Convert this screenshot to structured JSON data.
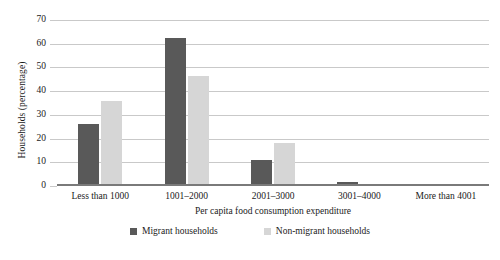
{
  "chart_data": {
    "type": "bar",
    "title": "",
    "xlabel": "Per capita food consumption expenditure",
    "ylabel": "Households (percentage)",
    "categories": [
      "Less than 1000",
      "1001–2000",
      "2001–3000",
      "3001–4000",
      "More than 4001"
    ],
    "series": [
      {
        "name": "Migrant households",
        "color": "#595959",
        "values": [
          26.0,
          62.5,
          10.8,
          1.5,
          0.4
        ]
      },
      {
        "name": "Non-migrant households",
        "color": "#d6d6d6",
        "values": [
          36.0,
          46.5,
          18.2,
          0.5,
          0.2
        ]
      }
    ],
    "ylim": [
      0,
      70
    ],
    "yticks": [
      0,
      10,
      20,
      30,
      40,
      50,
      60,
      70
    ],
    "ytick_labels": [
      "0",
      "10",
      "20",
      "30",
      "40",
      "50",
      "60",
      "70"
    ],
    "grid": "horizontal",
    "legend_position": "bottom"
  },
  "legend": {
    "items": [
      {
        "label": "Migrant households"
      },
      {
        "label": "Non-migrant households"
      }
    ]
  }
}
